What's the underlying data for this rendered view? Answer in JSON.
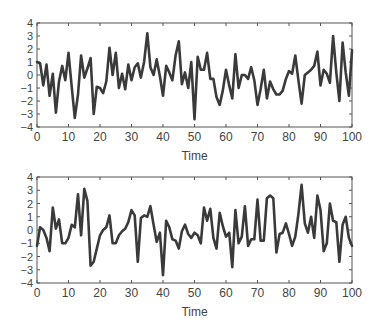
{
  "chart_data": [
    {
      "type": "line",
      "title": "",
      "xlabel": "Time",
      "ylabel": "",
      "xlim": [
        0,
        100
      ],
      "ylim": [
        -4,
        4
      ],
      "xticks": [
        0,
        10,
        20,
        30,
        40,
        50,
        60,
        70,
        80,
        90,
        100
      ],
      "yticks": [
        4,
        3,
        2,
        1,
        0,
        -1,
        -2,
        -3,
        -4
      ],
      "grid": false,
      "legend": null,
      "line_color": "#3a3a3a",
      "x": [
        0,
        1,
        2,
        3,
        4,
        5,
        6,
        7,
        8,
        9,
        10,
        11,
        12,
        13,
        14,
        15,
        16,
        17,
        18,
        19,
        20,
        21,
        22,
        23,
        24,
        25,
        26,
        27,
        28,
        29,
        30,
        31,
        32,
        33,
        34,
        35,
        36,
        37,
        38,
        39,
        40,
        41,
        42,
        43,
        44,
        45,
        46,
        47,
        48,
        49,
        50,
        51,
        52,
        53,
        54,
        55,
        56,
        57,
        58,
        59,
        60,
        61,
        62,
        63,
        64,
        65,
        66,
        67,
        68,
        69,
        70,
        71,
        72,
        73,
        74,
        75,
        76,
        77,
        78,
        79,
        80,
        81,
        82,
        83,
        84,
        85,
        86,
        87,
        88,
        89,
        90,
        91,
        92,
        93,
        94,
        95,
        96,
        97,
        98,
        99,
        100
      ],
      "values": [
        1.0,
        0.9,
        -0.8,
        0.8,
        -1.6,
        0.1,
        -2.9,
        -0.5,
        0.7,
        -0.4,
        1.7,
        -0.9,
        -3.3,
        -1.5,
        1.5,
        -0.2,
        0.5,
        1.3,
        -3.0,
        -0.9,
        -1.0,
        -1.4,
        -0.5,
        2.1,
        0.0,
        1.7,
        -1.0,
        0.1,
        -1.1,
        0.8,
        -0.4,
        0.6,
        0.9,
        -0.2,
        1.0,
        3.2,
        0.6,
        0.0,
        1.2,
        -0.1,
        -1.6,
        0.7,
        0.2,
        -0.4,
        1.5,
        2.6,
        -0.7,
        0.2,
        -1.0,
        1.0,
        -3.4,
        1.4,
        0.4,
        0.4,
        1.7,
        -0.3,
        -0.3,
        -1.7,
        -2.3,
        -1.2,
        0.4,
        -0.8,
        -1.8,
        1.6,
        -1.0,
        0.0,
        0.0,
        -0.3,
        0.6,
        -0.4,
        -2.3,
        -1.1,
        0.4,
        -1.8,
        -0.5,
        -1.1,
        -1.5,
        -1.5,
        -1.2,
        -0.3,
        0.3,
        0.1,
        1.5,
        -0.4,
        -2.2,
        0.0,
        0.2,
        0.4,
        0.7,
        1.8,
        -0.8,
        0.4,
        0.1,
        -0.6,
        3.0,
        0.2,
        -2.0,
        2.5,
        0.2,
        -1.6,
        1.9
      ]
    },
    {
      "type": "line",
      "title": "",
      "xlabel": "Time",
      "ylabel": "",
      "xlim": [
        0,
        100
      ],
      "ylim": [
        -4,
        4
      ],
      "xticks": [
        0,
        10,
        20,
        30,
        40,
        50,
        60,
        70,
        80,
        90,
        100
      ],
      "yticks": [
        4,
        3,
        2,
        1,
        0,
        -1,
        -2,
        -3,
        -4
      ],
      "grid": false,
      "legend": null,
      "line_color": "#3a3a3a",
      "x": [
        0,
        1,
        2,
        3,
        4,
        5,
        6,
        7,
        8,
        9,
        10,
        11,
        12,
        13,
        14,
        15,
        16,
        17,
        18,
        19,
        20,
        21,
        22,
        23,
        24,
        25,
        26,
        27,
        28,
        29,
        30,
        31,
        32,
        33,
        34,
        35,
        36,
        37,
        38,
        39,
        40,
        41,
        42,
        43,
        44,
        45,
        46,
        47,
        48,
        49,
        50,
        51,
        52,
        53,
        54,
        55,
        56,
        57,
        58,
        59,
        60,
        61,
        62,
        63,
        64,
        65,
        66,
        67,
        68,
        69,
        70,
        71,
        72,
        73,
        74,
        75,
        76,
        77,
        78,
        79,
        80,
        81,
        82,
        83,
        84,
        85,
        86,
        87,
        88,
        89,
        90,
        91,
        92,
        93,
        94,
        95,
        96,
        97,
        98,
        99,
        100
      ],
      "values": [
        -1.2,
        0.2,
        0.0,
        -0.6,
        -1.6,
        1.7,
        0.1,
        0.8,
        -1.0,
        -1.0,
        -0.6,
        0.4,
        0.2,
        2.7,
        -0.4,
        3.1,
        2.2,
        -2.7,
        -2.4,
        -1.4,
        -0.4,
        0.0,
        0.2,
        1.1,
        -1.0,
        -1.0,
        -0.4,
        -0.1,
        0.1,
        0.6,
        1.5,
        1.1,
        -2.4,
        0.9,
        1.1,
        1.0,
        1.8,
        0.4,
        -0.9,
        -0.2,
        -3.4,
        0.7,
        0.2,
        -0.7,
        -0.8,
        -1.4,
        -0.1,
        0.4,
        -0.3,
        -0.6,
        -0.2,
        -0.4,
        -1.0,
        1.7,
        0.7,
        1.6,
        -0.6,
        -1.4,
        1.3,
        0.3,
        -0.5,
        -0.2,
        -2.8,
        1.5,
        -1.0,
        -0.5,
        1.8,
        -1.2,
        -0.7,
        -0.7,
        2.3,
        -0.8,
        -0.8,
        2.4,
        2.6,
        2.4,
        -1.7,
        -0.3,
        -0.2,
        0.5,
        -0.3,
        -1.2,
        -0.5,
        1.2,
        3.4,
        0.5,
        -0.2,
        1.0,
        -0.6,
        2.6,
        1.5,
        -1.6,
        -1.0,
        2.0,
        0.7,
        0.6,
        -2.4,
        0.4,
        1.0,
        -0.6,
        -1.2
      ]
    }
  ],
  "figure": {
    "subplots": [
      {
        "xlabel": "Time",
        "tick_labels_x": [
          "0",
          "10",
          "20",
          "30",
          "40",
          "50",
          "60",
          "70",
          "80",
          "90",
          "100"
        ],
        "tick_labels_y": [
          "4",
          "3",
          "2",
          "1",
          "0",
          "−1",
          "−2",
          "−3",
          "−4"
        ]
      },
      {
        "xlabel": "Time",
        "tick_labels_x": [
          "0",
          "10",
          "20",
          "30",
          "40",
          "50",
          "60",
          "70",
          "80",
          "90",
          "100"
        ],
        "tick_labels_y": [
          "4",
          "3",
          "2",
          "1",
          "0",
          "−1",
          "−2",
          "−3",
          "−4"
        ]
      }
    ]
  }
}
